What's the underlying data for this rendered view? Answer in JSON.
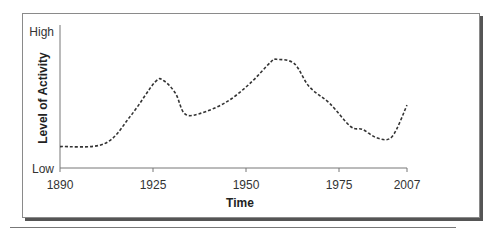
{
  "chart_data": {
    "type": "line",
    "title": "",
    "xlabel": "Time",
    "ylabel": "Level of Activity",
    "x_ticks": [
      "1890",
      "1925",
      "1950",
      "1975",
      "2007"
    ],
    "y_ticks": [
      "Low",
      "High"
    ],
    "xlim": [
      1890,
      2007
    ],
    "ylim": [
      0,
      100
    ],
    "grid": false,
    "legend": null,
    "line_style": "dashed",
    "series": [
      {
        "name": "Level of Activity",
        "x": [
          1890,
          1905,
          1914,
          1922,
          1925,
          1929,
          1932,
          1937,
          1946,
          1954,
          1961,
          1963,
          1969,
          1974,
          1981,
          1988,
          1992,
          1997,
          2002,
          2007
        ],
        "values": [
          15,
          17,
          37,
          60,
          61,
          52,
          38,
          38,
          46,
          59,
          74,
          76,
          73,
          57,
          45,
          29,
          27,
          21,
          22,
          44
        ]
      }
    ]
  },
  "axes": {
    "x_title": "Time",
    "y_title": "Level of Activity",
    "y_high": "High",
    "y_low": "Low",
    "x_ticks": [
      "1890",
      "1925",
      "1950",
      "1975",
      "2007"
    ]
  },
  "colors": {
    "line": "#333333",
    "axis": "#666666",
    "frame_shadow": "#555555"
  }
}
